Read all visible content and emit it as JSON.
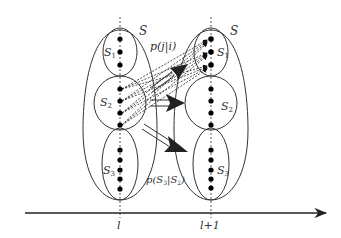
{
  "diagram": {
    "colors": {
      "stroke": "#333333",
      "dot": "#000000",
      "arrow_fill": "#222222",
      "background": "#ffffff"
    },
    "axis": {
      "labels": [
        {
          "text": "l",
          "x": 120
        },
        {
          "text": "l+1",
          "x": 211
        }
      ]
    },
    "columns": [
      {
        "name": "left",
        "x": 120,
        "outer_label": "S",
        "clusters": [
          {
            "label": "S",
            "sub": "1",
            "dots": [
              39,
              52,
              65
            ]
          },
          {
            "label": "S",
            "sub": "2",
            "dots": [
              89,
              101,
              113,
              125
            ]
          },
          {
            "label": "S",
            "sub": "3",
            "dots": [
              150,
              160,
              170,
              179,
              189
            ]
          }
        ]
      },
      {
        "name": "right",
        "x": 211,
        "outer_label": "S",
        "clusters": [
          {
            "label": "S",
            "sub": "1",
            "dots": [
              39,
              52,
              65
            ]
          },
          {
            "label": "S",
            "sub": "2",
            "dots": [
              89,
              101,
              113,
              125
            ]
          },
          {
            "label": "S",
            "sub": "3",
            "dots": [
              150,
              160,
              170,
              179,
              188
            ]
          }
        ]
      }
    ],
    "annotations": {
      "transition_label": "p(j|i)",
      "cluster_transition_label": "p(S3|S2)",
      "cluster_transition_parts": {
        "p": "p(",
        "s3": "S",
        "s3sub": "3",
        "bar": "|",
        "s2": "S",
        "s2sub": "2",
        "close": ")"
      }
    }
  }
}
